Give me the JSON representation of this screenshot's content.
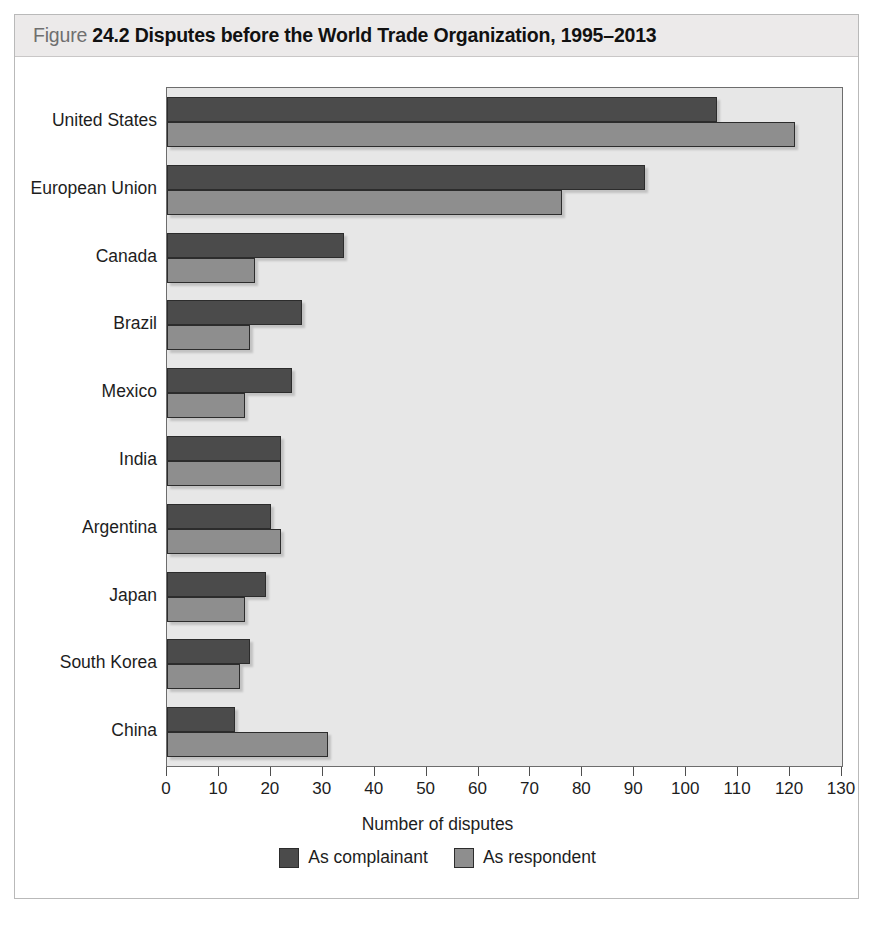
{
  "figure": {
    "label_word": "Figure",
    "number": "24.2",
    "title": "Disputes before the World Trade Organization, 1995–2013"
  },
  "chart_data": {
    "type": "bar",
    "orientation": "horizontal",
    "title": "Disputes before the World Trade Organization, 1995–2013",
    "xlabel": "Number of disputes",
    "ylabel": "",
    "xlim": [
      0,
      130
    ],
    "xticks": [
      0,
      10,
      20,
      30,
      40,
      50,
      60,
      70,
      80,
      90,
      100,
      110,
      120,
      130
    ],
    "grid": false,
    "legend_position": "bottom",
    "categories": [
      "United States",
      "European Union",
      "Canada",
      "Brazil",
      "Mexico",
      "India",
      "Argentina",
      "Japan",
      "South Korea",
      "China"
    ],
    "series": [
      {
        "name": "As complainant",
        "color": "#4b4b4b",
        "values": [
          106,
          92,
          34,
          26,
          24,
          22,
          20,
          19,
          16,
          13
        ]
      },
      {
        "name": "As respondent",
        "color": "#8e8e8e",
        "values": [
          121,
          76,
          17,
          16,
          15,
          22,
          22,
          15,
          14,
          31
        ]
      }
    ]
  },
  "axis": {
    "x_title": "Number of disputes"
  },
  "colors": {
    "complainant": "#4b4b4b",
    "respondent": "#8e8e8e",
    "plot_background": "#e7e7e7",
    "header_band": "#eceaea",
    "frame_border": "#b9b9b9"
  }
}
